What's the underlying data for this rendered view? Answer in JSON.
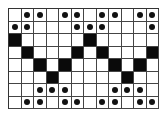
{
  "diagram": {
    "type": "pattern-grid",
    "rows": 8,
    "cols": 12,
    "legend": {
      ".": "empty",
      "o": "dot",
      "#": "filled"
    },
    "grid": [
      ". o o . o o . o o . o o",
      "o o . . . o o o . . . o",
      "# . . . . . # . . . . .",
      ". # . . . # . # . . . #",
      ". . # . # . . . # . # .",
      ". . . # . . . . . # . .",
      ". . o o o . . . o o o .",
      ". o o . o o . o o . o o"
    ],
    "colors": {
      "filled": "#0a0a0a",
      "dot": "#111111",
      "line": "#444444",
      "background": "#ffffff"
    }
  }
}
